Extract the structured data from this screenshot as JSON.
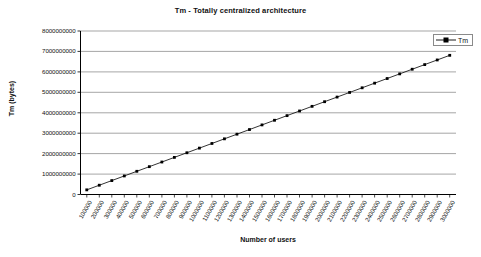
{
  "chart_data": {
    "type": "line",
    "title": "Tm - Totally centralized architecture",
    "xlabel": "Number of users",
    "ylabel": "Tm (bytes)",
    "grid": "horizontal",
    "legend_position": "top-right",
    "ylim": [
      0,
      8000000000
    ],
    "ytick_labels": [
      "8000000000",
      "7000000000",
      "6000000000",
      "5000000000",
      "4000000000",
      "3000000000",
      "2000000000",
      "1000000000",
      "0"
    ],
    "yticks": [
      8000000000,
      7000000000,
      6000000000,
      5000000000,
      4000000000,
      3000000000,
      2000000000,
      1000000000,
      0
    ],
    "categories": [
      "100000",
      "200000",
      "300000",
      "400000",
      "500000",
      "600000",
      "700000",
      "800000",
      "900000",
      "1000000",
      "1100000",
      "1200000",
      "1300000",
      "1400000",
      "1500000",
      "1600000",
      "1700000",
      "1800000",
      "1900000",
      "2000000",
      "2100000",
      "2200000",
      "2300000",
      "2400000",
      "2500000",
      "2600000",
      "2700000",
      "2800000",
      "2900000",
      "3000000"
    ],
    "series": [
      {
        "name": "Tm",
        "marker": "square",
        "color": "#000000",
        "values": [
          227000000,
          454000000,
          681000000,
          908000000,
          1135000000,
          1362000000,
          1589000000,
          1816000000,
          2043000000,
          2270000000,
          2497000000,
          2724000000,
          2951000000,
          3178000000,
          3405000000,
          3632000000,
          3859000000,
          4086000000,
          4313000000,
          4540000000,
          4767000000,
          4994000000,
          5221000000,
          5448000000,
          5675000000,
          5902000000,
          6129000000,
          6356000000,
          6583000000,
          6810000000
        ]
      }
    ]
  },
  "legend": {
    "entries": [
      {
        "label": "Tm"
      }
    ]
  },
  "colors": {
    "series_line": "#000000",
    "gridline": "#808080",
    "axis": "#000000",
    "background": "#ffffff"
  }
}
